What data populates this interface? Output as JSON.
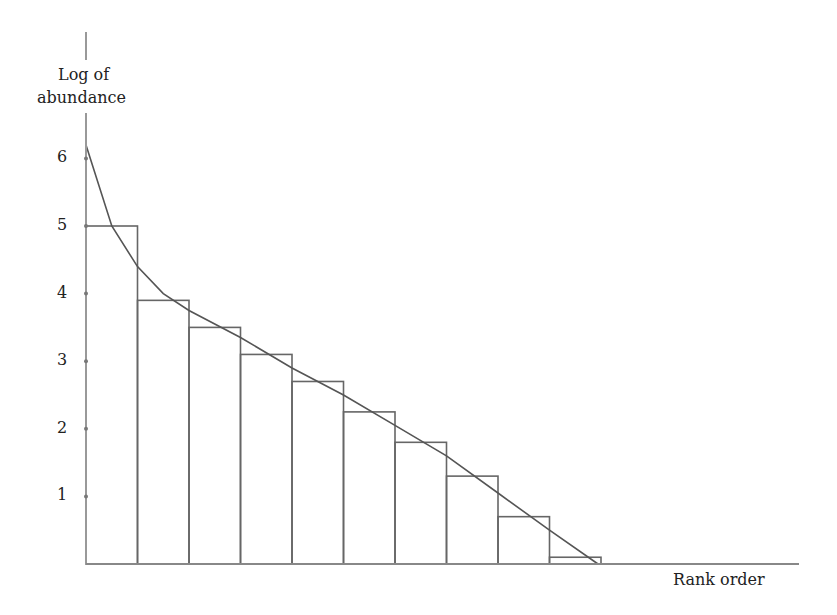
{
  "chart_data": {
    "type": "bar",
    "title": "",
    "xlabel": "Rank order",
    "ylabel": "Log of abundance",
    "ylabel_lines": [
      "Log of",
      "abundance"
    ],
    "yticks": [
      1,
      2,
      3,
      4,
      5,
      6
    ],
    "ylim": [
      0,
      6.5
    ],
    "grid": false,
    "legend": null,
    "categories": [
      1,
      2,
      3,
      4,
      5,
      6,
      7,
      8,
      9,
      10
    ],
    "values": [
      5.0,
      3.9,
      3.5,
      3.1,
      2.7,
      2.25,
      1.8,
      1.3,
      0.7,
      0.1
    ],
    "series": [
      {
        "name": "Species abundance (bars)",
        "type": "bar",
        "values": [
          5.0,
          3.9,
          3.5,
          3.1,
          2.7,
          2.25,
          1.8,
          1.3,
          0.7,
          0.1
        ]
      },
      {
        "name": "Fitted curve",
        "type": "line",
        "x": [
          0,
          0.5,
          1,
          1.5,
          2,
          3,
          4,
          5,
          6,
          7,
          8,
          9,
          10
        ],
        "values": [
          6.2,
          5.0,
          4.4,
          4.0,
          3.75,
          3.35,
          2.9,
          2.5,
          2.05,
          1.6,
          1.05,
          0.5,
          0.0
        ]
      }
    ]
  },
  "labels": {
    "y_line1": "Log of",
    "y_line2": "abundance",
    "x": "Rank order",
    "ticks": [
      "1",
      "2",
      "3",
      "4",
      "5",
      "6"
    ]
  }
}
